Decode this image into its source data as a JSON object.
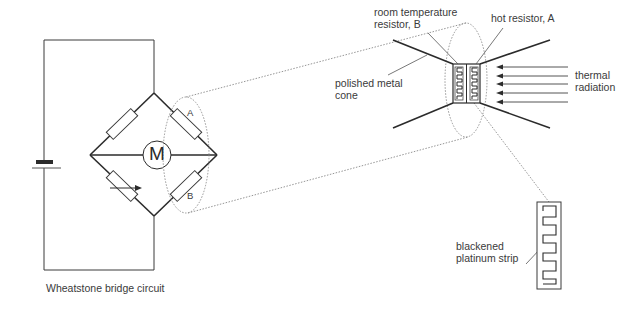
{
  "diagram": {
    "caption": "Wheatstone bridge circuit",
    "meter_label": "M",
    "resistor_a_label": "A",
    "resistor_b_label": "B",
    "labels": {
      "room_temp_line1": "room temperature",
      "room_temp_line2": "resistor, B",
      "hot_resistor": "hot resistor, A",
      "cone_line1": "polished metal",
      "cone_line2": "cone",
      "thermal_line1": "thermal",
      "thermal_line2": "radiation",
      "strip_line1": "blackened",
      "strip_line2": "platinum strip"
    },
    "colors": {
      "line": "#2b2b2b",
      "text": "#3a3a3a",
      "dotted": "#8a8a8a"
    }
  }
}
